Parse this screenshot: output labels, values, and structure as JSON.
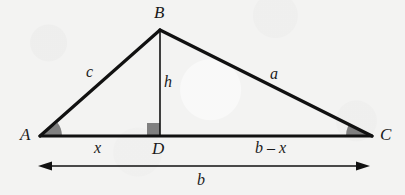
{
  "figure": {
    "kind": "geometry-diagram",
    "background_color": "#f3f3f2",
    "stroke_color": "#111111",
    "angle_fill_color": "#808080",
    "right_angle_fill_color": "#808080",
    "vertices": [
      {
        "id": "A",
        "label": "A",
        "x": 40,
        "y": 136,
        "label_x": 20,
        "label_y": 126
      },
      {
        "id": "B",
        "label": "B",
        "x": 160,
        "y": 30,
        "label_x": 154,
        "label_y": 4
      },
      {
        "id": "C",
        "label": "C",
        "x": 372,
        "y": 136,
        "label_x": 380,
        "label_y": 126
      },
      {
        "id": "D",
        "label": "D",
        "x": 160,
        "y": 136,
        "label_x": 152,
        "label_y": 140
      }
    ],
    "side_labels": [
      {
        "id": "c",
        "label": "c",
        "x": 86,
        "y": 64,
        "for": "AB"
      },
      {
        "id": "h",
        "label": "h",
        "x": 164,
        "y": 74,
        "for": "BD"
      },
      {
        "id": "a",
        "label": "a",
        "x": 270,
        "y": 66,
        "for": "BC"
      }
    ],
    "segment_labels": [
      {
        "id": "x",
        "label": "x",
        "x": 94,
        "y": 140,
        "for": "AD"
      },
      {
        "id": "b-x",
        "label": "b – x",
        "x": 255,
        "y": 140,
        "for": "DC"
      },
      {
        "id": "b",
        "label": "b",
        "x": 197,
        "y": 172,
        "for": "AC-dimension"
      }
    ],
    "dimension_arrow": {
      "label": "b",
      "x1": 38,
      "x2": 370,
      "y": 166,
      "double_headed": true
    },
    "angle_marks": [
      {
        "id": "angle-A",
        "vertex": "A",
        "type": "filled-wedge",
        "radius": 22
      },
      {
        "id": "angle-C",
        "vertex": "C",
        "type": "filled-wedge",
        "radius": 26
      },
      {
        "id": "angle-D",
        "vertex": "D",
        "type": "right-angle-square",
        "size": 13
      }
    ]
  }
}
